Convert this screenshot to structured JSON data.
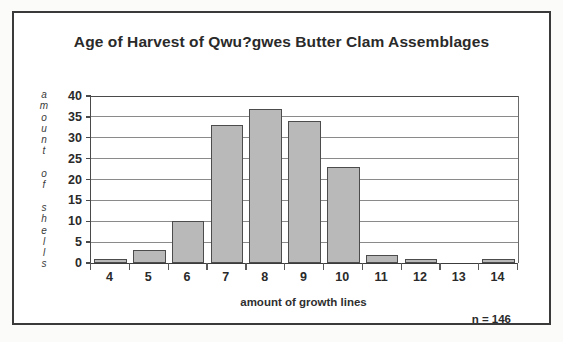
{
  "figure": {
    "title": "Age of Harvest of Qwu?gwes Butter Clam Assemblages",
    "sample_size_note": "n = 146",
    "frame_color": "#3a3a3a",
    "bar_fill_color": "#b9b9b9",
    "bar_border_color": "#4c4c4c",
    "gridline_color": "#8a8a8a",
    "background_color": "#ffffff"
  },
  "axes": {
    "y_title_vertical": "a\nm\no\nu\nn\nt\n\no\nf\n\ns\nh\ne\nl\nl\ns",
    "y_title_plain": "amount of shells",
    "x_title": "amount of growth lines",
    "y_ticks": [
      "0",
      "5",
      "10",
      "15",
      "20",
      "25",
      "30",
      "35",
      "40"
    ],
    "x_ticks": [
      "4",
      "5",
      "6",
      "7",
      "8",
      "9",
      "10",
      "11",
      "12",
      "13",
      "14"
    ]
  },
  "chart_data": {
    "type": "bar",
    "title": "Age of Harvest of Qwu?gwes Butter Clam Assemblages",
    "xlabel": "amount of growth lines",
    "ylabel": "amount of shells",
    "categories": [
      "4",
      "5",
      "6",
      "7",
      "8",
      "9",
      "10",
      "11",
      "12",
      "13",
      "14"
    ],
    "values": [
      1,
      3,
      10,
      33,
      37,
      34,
      23,
      2,
      1,
      0,
      1
    ],
    "ylim": [
      0,
      40
    ],
    "ytick_step": 5,
    "grid": true,
    "legend": "none",
    "annotations": [
      "n = 146"
    ],
    "total_n": 146
  }
}
